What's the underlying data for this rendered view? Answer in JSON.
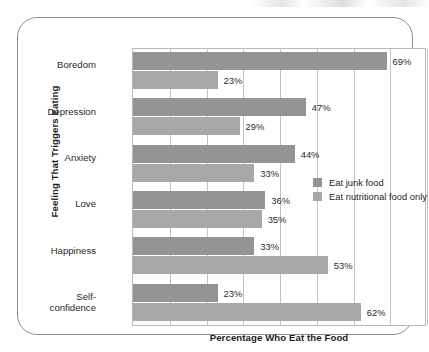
{
  "chart_data": {
    "type": "bar",
    "orientation": "horizontal",
    "title": "",
    "xlabel": "Percentage Who Eat the Food",
    "ylabel": "Feeling That Triggers Eating",
    "categories": [
      "Boredom",
      "Depression",
      "Anxiety",
      "Love",
      "Happiness",
      "Self-confidence"
    ],
    "series": [
      {
        "name": "Eat junk food",
        "color": "#949494",
        "values": [
          69,
          47,
          44,
          36,
          33,
          23
        ],
        "value_labels": [
          "69%",
          "47%",
          "44%",
          "36%",
          "33%",
          "23%"
        ]
      },
      {
        "name": "Eat nutritional food only",
        "color": "#a8a8a8",
        "values": [
          23,
          29,
          33,
          35,
          53,
          62
        ],
        "value_labels": [
          "23%",
          "29%",
          "33%",
          "35%",
          "53%",
          "62%"
        ]
      }
    ],
    "xlim": [
      0,
      80
    ],
    "xticks": [
      0,
      10,
      20,
      30,
      40,
      50,
      60,
      70,
      80
    ],
    "xtick_labels": [
      "",
      "",
      "",
      "",
      "",
      "",
      "",
      "",
      ""
    ],
    "grid": "vertical",
    "legend_position": "center-right"
  },
  "legend": {
    "items": [
      {
        "label": "Eat junk food",
        "color": "#949494"
      },
      {
        "label": "Eat nutritional food only",
        "color": "#a8a8a8"
      }
    ]
  },
  "axes": {
    "x_title": "Percentage Who Eat the Food",
    "y_title": "Feeling That Triggers Eating"
  },
  "colors": {
    "junk_food": "#949494",
    "nutritional_food": "#a8a8a8",
    "gridline": "#c2c2c2",
    "frame_border": "#8d8d8d",
    "text": "#2a2a2a",
    "background": "#ffffff"
  }
}
